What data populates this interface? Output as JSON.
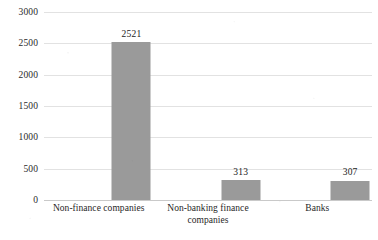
{
  "chart_data": {
    "type": "bar",
    "title": "",
    "subtitle": "",
    "xlabel": "",
    "ylabel": "",
    "categories": [
      "Non-finance companies",
      "Non-banking finance companies",
      "Banks"
    ],
    "values": [
      2521,
      313,
      307
    ],
    "data_labels": [
      "2521",
      "313",
      "307"
    ],
    "ylim": [
      0,
      3000
    ],
    "ytick_values": [
      0,
      500,
      1000,
      1500,
      2000,
      2500,
      3000
    ],
    "ytick_labels": [
      "0",
      "500",
      "1000",
      "1500",
      "2000",
      "2500",
      "3000"
    ],
    "grid": "horizontal",
    "legend": "none",
    "bar_color": "#9a9a9a",
    "gridline_color": "#e2e2e2",
    "axis_color": "#c9c9c9",
    "background_color": "#ffffff",
    "text_color": "#1c1c1c"
  }
}
